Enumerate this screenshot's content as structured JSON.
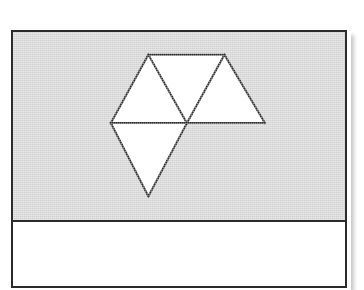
{
  "page": {
    "background_color": "#ffffff",
    "width": 364,
    "height": 280
  },
  "figure_card": {
    "name": "framed-figure",
    "border_color": "#2b2b2b",
    "border_width_px": 2,
    "frame_rect": {
      "x": 11,
      "y": 30,
      "width": 336,
      "height": 258
    },
    "bottom_cropped": true
  },
  "diagram_panel": {
    "background_color": "#d2d2d2",
    "divider_color": "#2b2b2b",
    "divider_y": 220,
    "height_px": 190
  },
  "caption_band": {
    "background_color": "#ffffff",
    "text": ""
  },
  "figure": {
    "title": "",
    "shape_name": "tetrahedron-net",
    "face_count": 4,
    "face_fill_color": "#ffffff",
    "edge_color": "#2d2d2d",
    "edge_width_px": 2,
    "vertices": {
      "top_left_apex": {
        "x": 148,
        "y": 53
      },
      "top_right_apex": {
        "x": 225,
        "y": 53
      },
      "left": {
        "x": 110,
        "y": 122
      },
      "center": {
        "x": 187,
        "y": 122
      },
      "right": {
        "x": 266,
        "y": 122
      },
      "bottom_apex": {
        "x": 148,
        "y": 196
      }
    },
    "faces": [
      {
        "id": "face-upper-left",
        "label": "",
        "orientation": "point-up",
        "points": "148,53 110,122 187,122"
      },
      {
        "id": "face-upper-middle",
        "label": "",
        "orientation": "point-down",
        "points": "148,53 225,53 187,122"
      },
      {
        "id": "face-upper-right",
        "label": "",
        "orientation": "point-up",
        "points": "225,53 187,122 266,122"
      },
      {
        "id": "face-lower",
        "label": "",
        "orientation": "point-down",
        "points": "110,122 187,122 148,196"
      }
    ],
    "edges": [
      {
        "id": "edge-top",
        "points": "148,53 225,53"
      },
      {
        "id": "edge-upper-left",
        "points": "148,53 110,122"
      },
      {
        "id": "edge-upper-middle",
        "points": "148,53 187,122"
      },
      {
        "id": "edge-upper-right",
        "points": "225,53 187,122"
      },
      {
        "id": "edge-right-slant",
        "points": "225,53 266,122"
      },
      {
        "id": "edge-horizontal",
        "points": "110,122 266,122"
      },
      {
        "id": "edge-lower-left",
        "points": "110,122 148,196"
      },
      {
        "id": "edge-lower-right",
        "points": "187,122 148,196"
      }
    ]
  }
}
